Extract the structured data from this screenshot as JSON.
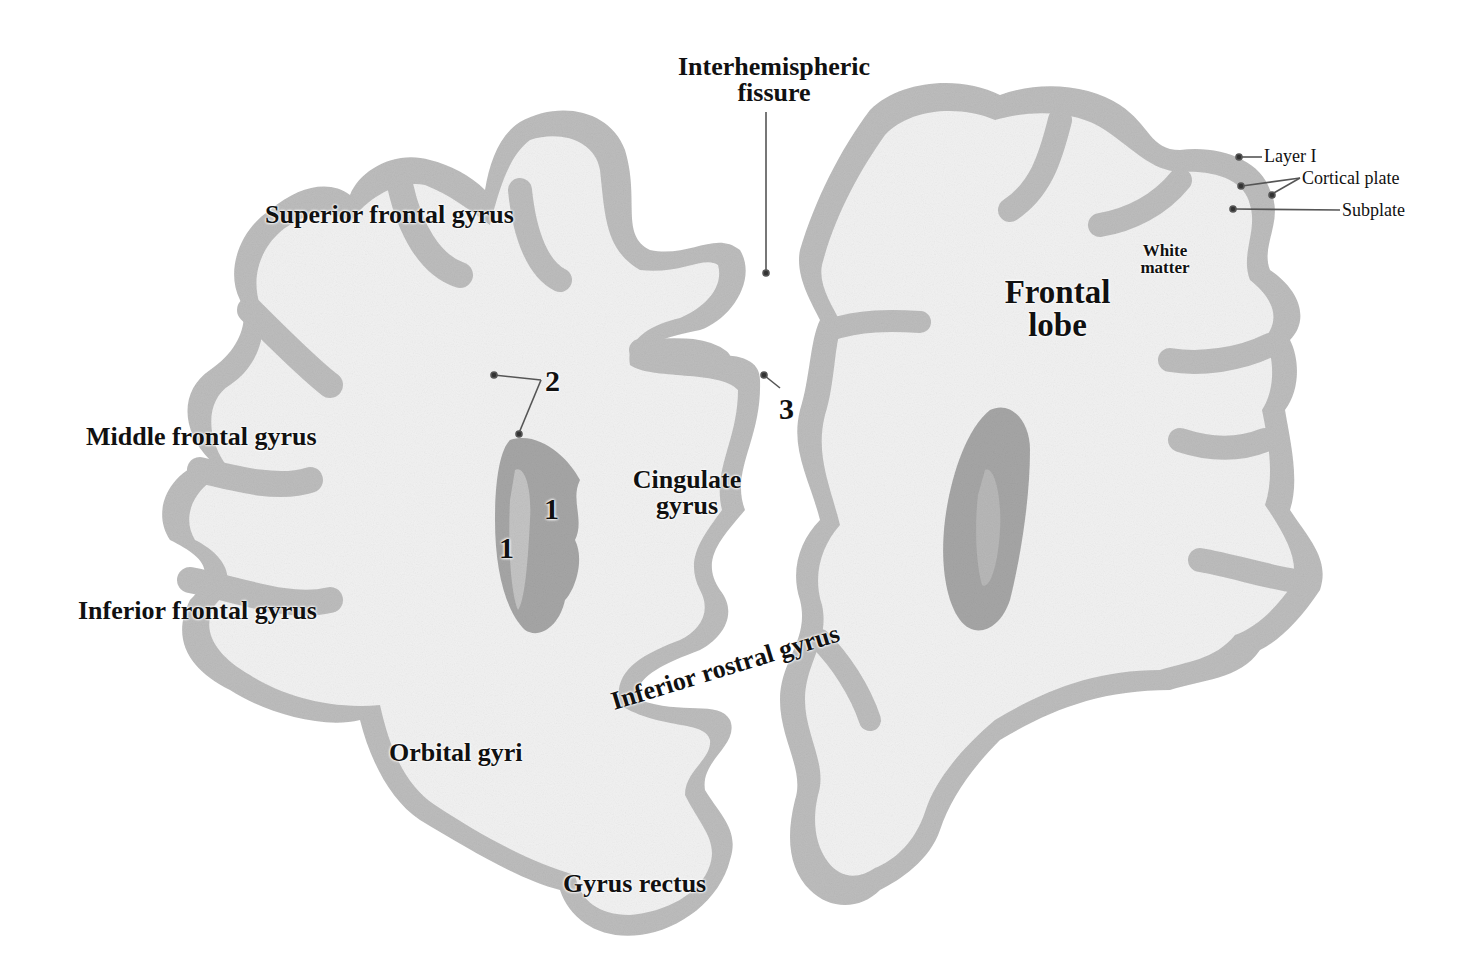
{
  "figure": {
    "type": "coronal brain section, frontal lobes (fetal)",
    "colors": {
      "background": "#ffffff",
      "white_matter": "#f1f1f1",
      "cortical_plate": "#b9b9b9",
      "subplate": "#d6d6d6",
      "deep_structure": "#a4a4a4",
      "label_text": "#111111",
      "leader_line": "#555555"
    }
  },
  "labels": {
    "interhemispheric_line1": "Interhemispheric",
    "interhemispheric_line2": "fissure",
    "superior_frontal_gyrus": "Superior frontal gyrus",
    "middle_frontal_gyrus": "Middle frontal gyrus",
    "inferior_frontal_gyrus": "Inferior frontal gyrus",
    "orbital_gyri": "Orbital gyri",
    "gyrus_rectus": "Gyrus rectus",
    "cingulate_line1": "Cingulate",
    "cingulate_line2": "gyrus",
    "inferior_rostral_gyrus": "Inferior rostral gyrus",
    "frontal_line1": "Frontal",
    "frontal_line2": "lobe",
    "white_line1": "White",
    "white_line2": "matter",
    "layer_i": "Layer I",
    "cortical_plate": "Cortical plate",
    "subplate": "Subplate"
  },
  "numbers": {
    "n1a": "1",
    "n1b": "1",
    "n2": "2",
    "n3": "3"
  }
}
